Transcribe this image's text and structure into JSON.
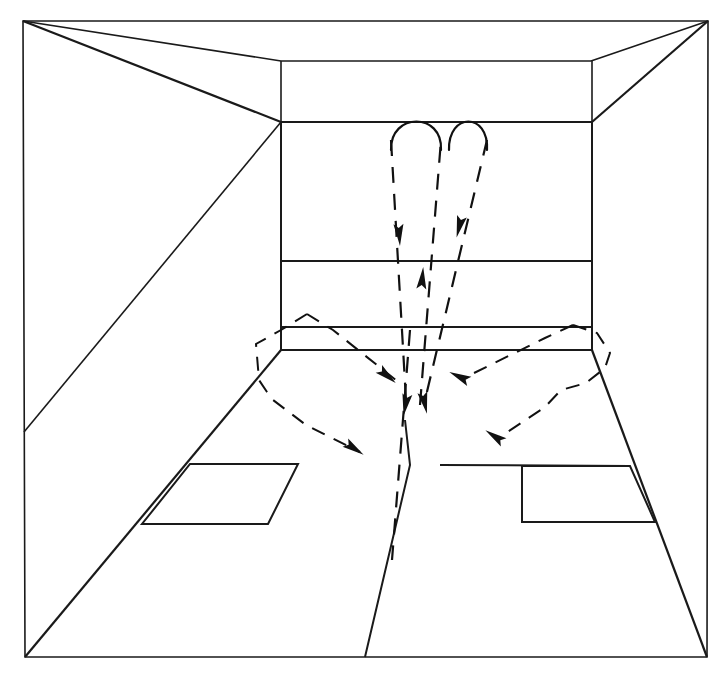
{
  "figure": {
    "domain_label": "line-drawing",
    "canvas": {
      "width": 726,
      "height": 679
    },
    "colors": {
      "background": "#ffffff",
      "line": "#1a1a1a",
      "flow": "#111111"
    }
  },
  "geometry": {
    "outer_frame": {
      "name": "outer-border",
      "points": "23,21 708,21 707,657 25,657",
      "closed": true
    },
    "ceiling_edges": [
      {
        "name": "ceiling-left-diagonal",
        "points": "23,21 281,61"
      },
      {
        "name": "ceiling-right-diagonal",
        "points": "708,21 591,61"
      },
      {
        "name": "ceiling-back-edge",
        "points": "281,61 591,61"
      }
    ],
    "back_wall": {
      "name": "back-wall-outline",
      "points": "281,122 592,122 592,350 281,350",
      "bands": [
        {
          "name": "back-wall-band-upper",
          "points": "281,261 592,261"
        },
        {
          "name": "back-wall-band-mid",
          "points": "281,327 592,327"
        }
      ],
      "verticals": [
        {
          "name": "back-wall-left-post",
          "points": "281,61 281,122"
        },
        {
          "name": "back-wall-right-post",
          "points": "592,61 592,122"
        }
      ]
    },
    "side_walls": [
      {
        "name": "left-wall-upper-diagonal",
        "points": "281,122 23,21"
      },
      {
        "name": "left-wall-floor-diagonal",
        "points": "281,350 25,657"
      },
      {
        "name": "left-wall-mid-diagonal",
        "points": "24,432 281,122"
      },
      {
        "name": "right-wall-upper-diagonal",
        "points": "592,122 708,21"
      },
      {
        "name": "right-wall-floor-diagonal",
        "points": "592,350 707,657"
      }
    ],
    "floor_panels": [
      {
        "name": "floor-panel-left",
        "points": "190,464 298,464 268,524 142,524"
      },
      {
        "name": "floor-panel-right",
        "points": "522,466 630,466 655,522 522,522"
      }
    ],
    "floor_center_line": {
      "name": "floor-center-line",
      "points": "365,657 410,465 405,420"
    },
    "floor_horizontals": [
      {
        "name": "floor-line-left",
        "points": "190,464 298,464"
      },
      {
        "name": "floor-line-right",
        "points": "440,465 630,466"
      }
    ]
  },
  "airflow": {
    "supply_loops": [
      {
        "name": "supply-loop-left",
        "label": "left inverted-U supply loop",
        "path": "M 391,150 C 390,112 443,112 441,150"
      },
      {
        "name": "supply-loop-right",
        "label": "right inverted-U supply loop",
        "path": "M 449,150 C 448,112 489,112 487,150"
      }
    ],
    "down_streams": [
      {
        "name": "flow-down-left",
        "label": "left descending supply jet",
        "path": "M 391,140 L 406,400",
        "arrow": {
          "x": 399,
          "y": 232,
          "angle": 86
        }
      },
      {
        "name": "flow-down-right",
        "label": "right descending supply jet",
        "path": "M 487,140 L 425,400",
        "arrow": {
          "x": 460,
          "y": 224,
          "angle": 104
        }
      }
    ],
    "return_stream": {
      "name": "flow-up-center",
      "label": "central rising return stream",
      "path": "M 420,405 L 441,140",
      "arrow": {
        "x": 422,
        "y": 281,
        "angle": -85
      }
    },
    "floor_center_stream": {
      "name": "flow-down-center-floor",
      "label": "center floor dashed stream",
      "path": "M 410,330 L 392,560"
    },
    "floor_polygons": [
      {
        "name": "floor-flow-polygon-left",
        "label": "left floor recirculation loop",
        "path": "M 307,314 L 333,330 L 397,381 M 307,314 L 281,330 L 256,344 L 259,380 L 267,392 L 273,400 L 306,425 L 360,452",
        "arrows": [
          {
            "x": 385,
            "y": 374,
            "angle": 40,
            "name": "arrow-left-inward"
          },
          {
            "x": 352,
            "y": 447,
            "angle": 34,
            "name": "arrow-left-outward"
          }
        ]
      },
      {
        "name": "floor-flow-polygon-right",
        "label": "right floor recirculation loop",
        "path": "M 573,325 L 545,338 L 470,375 M 573,325 L 597,333 L 610,353 L 605,368 L 586,383 L 561,390 L 545,407 L 500,437",
        "arrows": [
          {
            "x": 462,
            "y": 378,
            "angle": 205,
            "name": "arrow-right-inward"
          },
          {
            "x": 497,
            "y": 438,
            "angle": 214,
            "name": "arrow-right-outward"
          }
        ]
      }
    ],
    "convergence_marks": [
      {
        "name": "convergence-arrow-a",
        "x": 406,
        "y": 402,
        "angle": 100
      },
      {
        "name": "convergence-arrow-b",
        "x": 424,
        "y": 400,
        "angle": 78
      }
    ]
  }
}
